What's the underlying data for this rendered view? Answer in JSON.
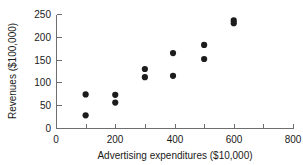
{
  "chart_data": {
    "type": "scatter",
    "title": "",
    "xlabel": "Advertising expenditures ($10,000)",
    "ylabel": "Revenues ($100,000)",
    "xlim": [
      0,
      800
    ],
    "ylim": [
      0,
      250
    ],
    "grid": false,
    "legend": null,
    "marker": {
      "shape": "circle",
      "color": "#1c1c1c",
      "size": 3.1
    },
    "xticks": [
      0,
      200,
      400,
      600,
      800
    ],
    "xtick_labels": [
      "0",
      "200",
      "400",
      "600",
      "800"
    ],
    "xminor_ticks": [
      100,
      300,
      500,
      700
    ],
    "yticks": [
      0,
      50,
      100,
      150,
      200,
      250
    ],
    "ytick_labels": [
      "0",
      "50",
      "100",
      "150",
      "200",
      "250"
    ],
    "x": [
      100,
      100,
      200,
      200,
      300,
      300,
      395,
      395,
      500,
      500,
      600,
      600
    ],
    "y": [
      74,
      28,
      73,
      56,
      130,
      112,
      165,
      115,
      183,
      152,
      237,
      231
    ],
    "points": [
      {
        "x": 100,
        "y": 74
      },
      {
        "x": 100,
        "y": 28
      },
      {
        "x": 200,
        "y": 73
      },
      {
        "x": 200,
        "y": 56
      },
      {
        "x": 300,
        "y": 130
      },
      {
        "x": 300,
        "y": 112
      },
      {
        "x": 395,
        "y": 165
      },
      {
        "x": 395,
        "y": 115
      },
      {
        "x": 500,
        "y": 183
      },
      {
        "x": 500,
        "y": 152
      },
      {
        "x": 600,
        "y": 237
      },
      {
        "x": 600,
        "y": 231
      }
    ]
  },
  "colors": {
    "background": "#ffffff",
    "axis": "#6e6e6e",
    "text": "#1a1a1a",
    "marker": "#1c1c1c"
  }
}
